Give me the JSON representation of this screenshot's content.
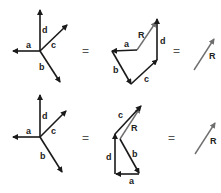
{
  "colors": {
    "vector": "#1a1a1a",
    "resultant": "#6e6e6e",
    "text": "#222222"
  },
  "rows": [
    {
      "concurrent": {
        "labels": {
          "a": "a",
          "b": "b",
          "c": "c",
          "d": "d"
        }
      },
      "equals1": "=",
      "polygon": {
        "order": [
          "a",
          "b",
          "c",
          "d"
        ],
        "labels": {
          "a": "a",
          "b": "b",
          "c": "c",
          "d": "d",
          "R": "R"
        }
      },
      "equals2": "=",
      "resultant": {
        "label": "R"
      }
    },
    {
      "concurrent": {
        "labels": {
          "a": "a",
          "b": "b",
          "c": "c",
          "d": "d"
        }
      },
      "equals1": "=",
      "polygon": {
        "order": [
          "b",
          "a",
          "d",
          "c"
        ],
        "labels": {
          "a": "a",
          "b": "b",
          "c": "c",
          "d": "d",
          "R": "R"
        }
      },
      "equals2": "=",
      "resultant": {
        "label": "R"
      }
    }
  ]
}
